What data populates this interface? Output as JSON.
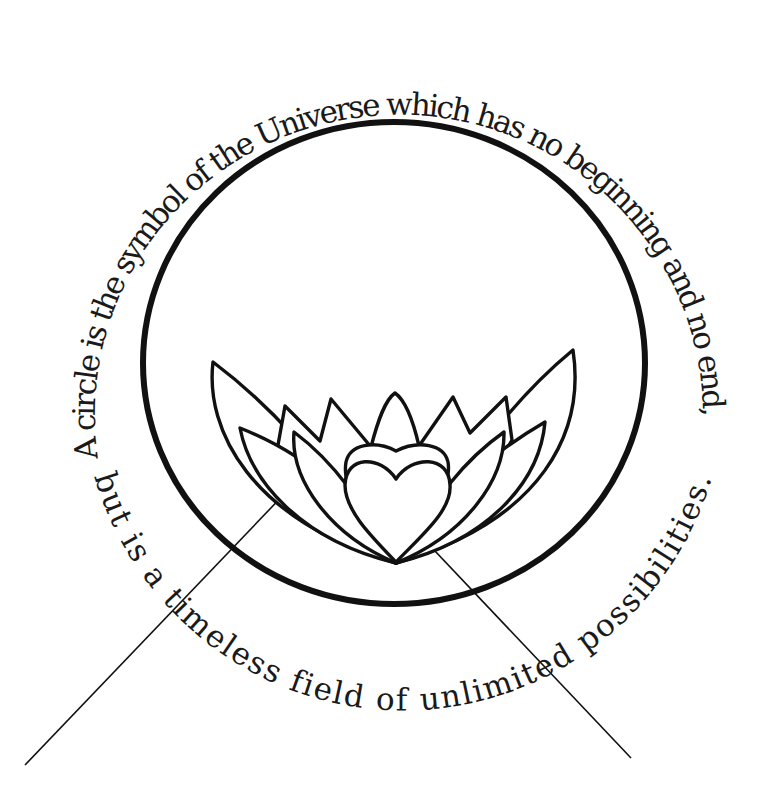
{
  "illustration": {
    "title": "Circle and lotus heart symbol",
    "quote": {
      "upper_text": "A circle is the symbol of the Universe which has no beginning and no end,",
      "lower_text": "but is a timeless field of unlimited possibilities."
    },
    "elements": {
      "ring": "large black circle outline",
      "lotus": "outlined lotus flower with layered petals",
      "heart": "heart shape at the centre of the lotus",
      "pointer_lines": [
        "left pointer line from lotus petal",
        "right pointer line from heart"
      ]
    },
    "colors": {
      "ink": "#111111",
      "background": "#ffffff"
    }
  }
}
